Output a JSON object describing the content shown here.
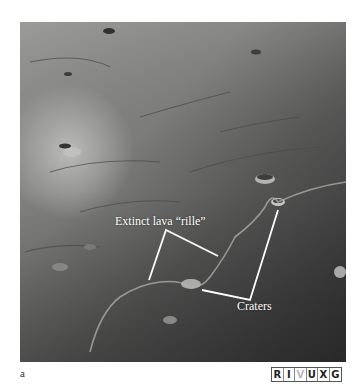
{
  "figure": {
    "panel_letter": "a",
    "annotations": {
      "rille_label": "Extinct lava “rille”",
      "craters_label": "Craters"
    },
    "wavelength_band": {
      "letters": [
        "R",
        "I",
        "V",
        "U",
        "X",
        "G"
      ],
      "highlighted": "V"
    },
    "colors": {
      "annotation": "#ffffff",
      "background": "#ffffff"
    }
  }
}
